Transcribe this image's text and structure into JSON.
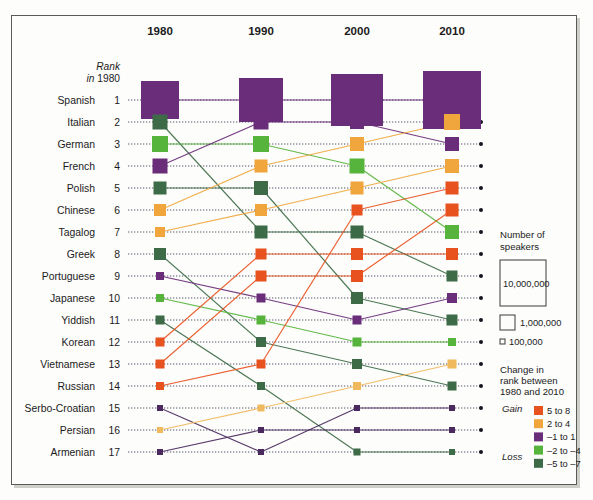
{
  "chart_data": {
    "type": "line",
    "title": "",
    "subtitle": "",
    "xlabel": "",
    "ylabel": "Rank in 1980",
    "grid": true,
    "years": [
      "1980",
      "1990",
      "2000",
      "2010"
    ],
    "rank_header_line1": "Rank",
    "rank_header_line2": "in 1980",
    "ylim": [
      1,
      17
    ],
    "series": [
      {
        "name": "Spanish",
        "rank_1980": 1,
        "ranks": [
          1,
          1,
          1,
          1
        ],
        "sizes": [
          38,
          44,
          52,
          58
        ],
        "color": "#6a2d7a",
        "change_band": "-1 to 1"
      },
      {
        "name": "Italian",
        "rank_1980": 2,
        "ranks": [
          2,
          7,
          7,
          9
        ],
        "sizes": [
          15,
          13,
          13,
          11
        ],
        "color": "#3d6b47",
        "change_band": "-5 to -7"
      },
      {
        "name": "German",
        "rank_1980": 3,
        "ranks": [
          3,
          3,
          4,
          7
        ],
        "sizes": [
          16,
          16,
          15,
          14
        ],
        "color": "#56b33c",
        "change_band": "-2 to -4"
      },
      {
        "name": "French",
        "rank_1980": 4,
        "ranks": [
          4,
          2,
          2,
          3
        ],
        "sizes": [
          15,
          15,
          14,
          14
        ],
        "color": "#6a2d7a",
        "change_band": "-1 to 1"
      },
      {
        "name": "Polish",
        "rank_1980": 5,
        "ranks": [
          5,
          5,
          10,
          11
        ],
        "sizes": [
          13,
          14,
          12,
          11
        ],
        "color": "#3d6b47",
        "change_band": "-5 to -7"
      },
      {
        "name": "Chinese",
        "rank_1980": 6,
        "ranks": [
          6,
          4,
          3,
          2
        ],
        "sizes": [
          12,
          13,
          14,
          16
        ],
        "color": "#f0a63c",
        "change_band": "2 to 4"
      },
      {
        "name": "Tagalog",
        "rank_1980": 7,
        "ranks": [
          7,
          6,
          5,
          4
        ],
        "sizes": [
          10,
          12,
          13,
          14
        ],
        "color": "#f0a63c",
        "change_band": "2 to 4"
      },
      {
        "name": "Greek",
        "rank_1980": 8,
        "ranks": [
          8,
          12,
          13,
          14
        ],
        "sizes": [
          12,
          10,
          10,
          9
        ],
        "color": "#3d6b47",
        "change_band": "-5 to -7"
      },
      {
        "name": "Portuguese",
        "rank_1980": 9,
        "ranks": [
          9,
          10,
          11,
          10
        ],
        "sizes": [
          8,
          9,
          9,
          10
        ],
        "color": "#6a2d7a",
        "change_band": "-1 to 1"
      },
      {
        "name": "Japanese",
        "rank_1980": 10,
        "ranks": [
          10,
          11,
          12,
          12
        ],
        "sizes": [
          8,
          9,
          9,
          8
        ],
        "color": "#56b33c",
        "change_band": "-2 to -4"
      },
      {
        "name": "Yiddish",
        "rank_1980": 11,
        "ranks": [
          11,
          14,
          17,
          17
        ],
        "sizes": [
          9,
          8,
          7,
          6
        ],
        "color": "#3d6b47",
        "change_band": "-5 to -7"
      },
      {
        "name": "Korean",
        "rank_1980": 12,
        "ranks": [
          12,
          8,
          8,
          8
        ],
        "sizes": [
          9,
          11,
          12,
          12
        ],
        "color": "#e8521e",
        "change_band": "5 to 8"
      },
      {
        "name": "Vietnamese",
        "rank_1980": 13,
        "ranks": [
          13,
          9,
          9,
          6
        ],
        "sizes": [
          9,
          11,
          12,
          13
        ],
        "color": "#e8521e",
        "change_band": "5 to 8"
      },
      {
        "name": "Russian",
        "rank_1980": 14,
        "ranks": [
          14,
          13,
          6,
          5
        ],
        "sizes": [
          8,
          9,
          11,
          13
        ],
        "color": "#e8521e",
        "change_band": "5 to 8"
      },
      {
        "name": "Serbo-Croatian",
        "rank_1980": 15,
        "ranks": [
          15,
          17,
          15,
          15
        ],
        "sizes": [
          6,
          6,
          6,
          6
        ],
        "color": "#4a2a5e",
        "change_band": "-1 to 1"
      },
      {
        "name": "Persian",
        "rank_1980": 16,
        "ranks": [
          16,
          15,
          14,
          13
        ],
        "sizes": [
          6,
          7,
          8,
          9
        ],
        "color": "#f0b95e",
        "change_band": "2 to 4"
      },
      {
        "name": "Armenian",
        "rank_1980": 17,
        "ranks": [
          17,
          16,
          16,
          16
        ],
        "sizes": [
          6,
          6,
          6,
          6
        ],
        "color": "#4a2a5e",
        "change_band": "-1 to 1"
      }
    ]
  },
  "legend": {
    "size": {
      "title_line1": "Number of",
      "title_line2": "speakers",
      "items": [
        {
          "label": "10,000,000",
          "px": 46
        },
        {
          "label": "1,000,000",
          "px": 15
        },
        {
          "label": "100,000",
          "px": 5
        }
      ]
    },
    "change": {
      "title_line1": "Change in",
      "title_line2": "rank between",
      "title_line3": "1980 and 2010",
      "gain_label": "Gain",
      "loss_label": "Loss",
      "items": [
        {
          "label": "5 to 8",
          "color": "#e8521e"
        },
        {
          "label": "2 to 4",
          "color": "#f0a63c"
        },
        {
          "label": "–1 to 1",
          "color": "#6a2d7a"
        },
        {
          "label": "–2 to –4",
          "color": "#56b33c"
        },
        {
          "label": "–5 to –7",
          "color": "#3d6b47"
        }
      ]
    }
  },
  "colors": {
    "gain_strong": "#e8521e",
    "gain_mild": "#f0a63c",
    "neutral": "#6a2d7a",
    "loss_mild": "#56b33c",
    "loss_strong": "#3d6b47",
    "background": "#fdfdfb",
    "frame": "#5a5a58",
    "text": "#1b1b1b"
  }
}
